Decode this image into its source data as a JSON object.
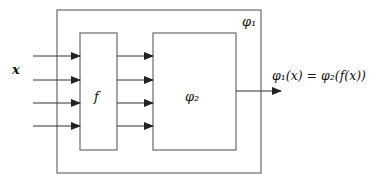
{
  "diagram": {
    "type": "block-diagram",
    "outer_box": {
      "label": "φ₁"
    },
    "f_box": {
      "label": "f"
    },
    "phi2_box": {
      "label": "φ₂"
    },
    "input_label": "x",
    "input_arrow_count": 4,
    "internal_arrow_count": 4,
    "output_label": "φ₁(x) = φ₂(f(x))",
    "colors": {
      "stroke": "#6a6a6a",
      "arrow": "#222222",
      "text": "#111111"
    }
  }
}
